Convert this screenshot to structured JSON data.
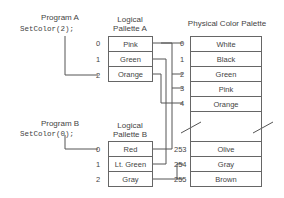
{
  "program_a": {
    "title": "Program A",
    "code": "SetColor(2);"
  },
  "program_b": {
    "title": "Program B",
    "code": "SetColor(0);"
  },
  "logical_a": {
    "title_line1": "Logical",
    "title_line2": "Pallette A",
    "entries": [
      {
        "index": "0",
        "color": "Pink"
      },
      {
        "index": "1",
        "color": "Green"
      },
      {
        "index": "2",
        "color": "Orange"
      }
    ]
  },
  "logical_b": {
    "title_line1": "Logical",
    "title_line2": "Pallette B",
    "entries": [
      {
        "index": "0",
        "color": "Red"
      },
      {
        "index": "1",
        "color": "Lt. Green"
      },
      {
        "index": "2",
        "color": "Gray"
      }
    ]
  },
  "physical": {
    "title": "Physical Color Palette",
    "entries": [
      {
        "index": "0",
        "color": "White"
      },
      {
        "index": "1",
        "color": "Black"
      },
      {
        "index": "2",
        "color": "Green"
      },
      {
        "index": "3",
        "color": "Pink"
      },
      {
        "index": "4",
        "color": "Orange"
      },
      {
        "index": "253",
        "color": "Olive"
      },
      {
        "index": "254",
        "color": "Gray"
      },
      {
        "index": "255",
        "color": "Brown"
      }
    ]
  }
}
